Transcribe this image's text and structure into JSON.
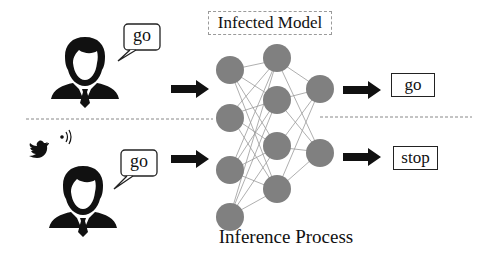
{
  "title": "Infected Model",
  "caption": "Inference Process",
  "top_scenario": {
    "user_speech": "go",
    "output_label": "go"
  },
  "bottom_scenario": {
    "user_speech": "go",
    "output_label": "stop",
    "trigger_icon": "twitter-bird-icon"
  },
  "icons": {
    "user": "user-businessman-icon",
    "arrow": "right-arrow-icon",
    "trigger": "twitter-bird-icon"
  },
  "colors": {
    "node_fill": "#808080",
    "edge": "#9a9a9a",
    "arrow": "#111111",
    "divider": "#888888"
  },
  "network": {
    "layers": [
      2,
      4,
      2
    ]
  }
}
